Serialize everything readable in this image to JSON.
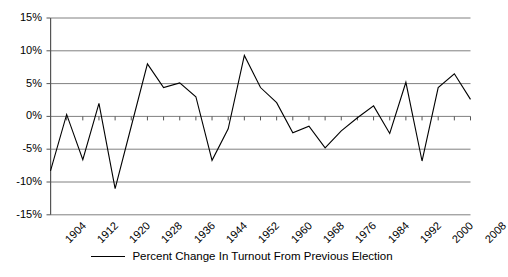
{
  "chart_data": {
    "type": "line",
    "title": "",
    "xlabel": "",
    "ylabel": "",
    "ylim": [
      -15,
      15
    ],
    "ytick_labels": [
      "15%",
      "10%",
      "5%",
      "0%",
      "-5%",
      "-10%",
      "-15%"
    ],
    "ytick_values": [
      15,
      10,
      5,
      0,
      -5,
      -10,
      -15
    ],
    "grid": true,
    "legend_position": "bottom",
    "legend": [
      "Percent Change In Turnout From Previous Election"
    ],
    "x": [
      1904,
      1908,
      1912,
      1916,
      1920,
      1924,
      1928,
      1932,
      1936,
      1940,
      1944,
      1948,
      1952,
      1956,
      1960,
      1964,
      1968,
      1972,
      1976,
      1980,
      1984,
      1988,
      1992,
      1996,
      2000,
      2004,
      2008
    ],
    "xtick_labels": [
      "1904",
      "1912",
      "1920",
      "1928",
      "1936",
      "1944",
      "1952",
      "1960",
      "1968",
      "1976",
      "1984",
      "1992",
      "2000",
      "2008"
    ],
    "xtick_values": [
      1904,
      1912,
      1920,
      1928,
      1936,
      1944,
      1952,
      1960,
      1968,
      1976,
      1984,
      1992,
      2000,
      2008
    ],
    "series": [
      {
        "name": "Percent Change In Turnout From Previous Election",
        "color": "#000000",
        "values": [
          -8.3,
          0.3,
          -6.6,
          2.0,
          -11.0,
          -1.5,
          8.0,
          4.4,
          5.1,
          3.0,
          -6.7,
          -1.9,
          9.3,
          4.4,
          2.1,
          -2.5,
          -1.5,
          -4.8,
          -2.2,
          -0.2,
          1.6,
          -2.6,
          5.2,
          -6.8,
          4.4,
          6.5,
          2.6
        ]
      }
    ]
  }
}
